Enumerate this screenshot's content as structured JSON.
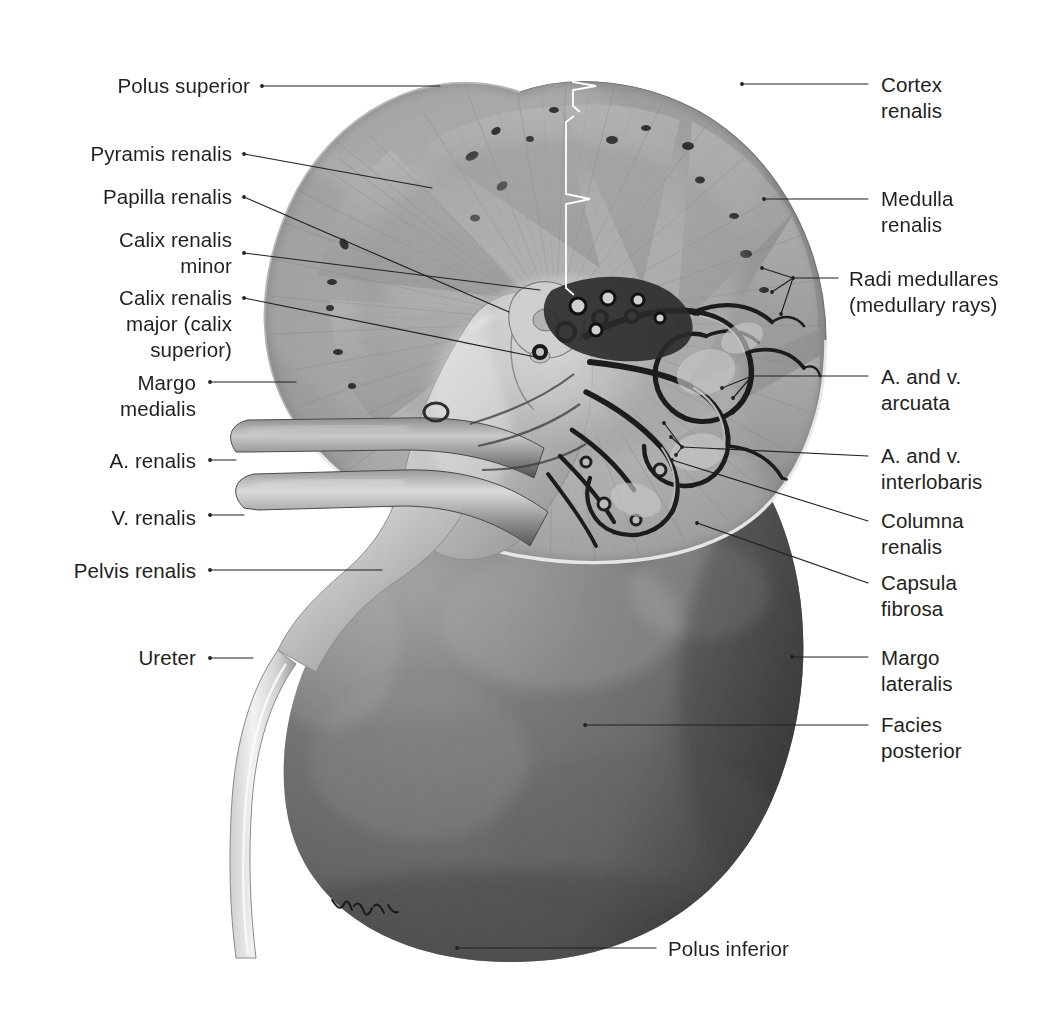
{
  "plate": {
    "title": "Right kidney, frontal section (posterior half), anatomical plate",
    "subject": "Ren (kidney) — coronal section showing cortex, medulla and vasculature",
    "background_color": "#ffffff",
    "text_color": "#231f20",
    "leader_color": "#231f20",
    "bracket_color": "#ffffff",
    "artist_signature": "Voll"
  },
  "labels_left": [
    {
      "id": "polus-superior",
      "text": "Polus superior",
      "align": "right",
      "x": 250,
      "y": 73,
      "lines": [
        "Polus superior"
      ]
    },
    {
      "id": "pyramis-renalis",
      "text": "Pyramis renalis",
      "align": "right",
      "x": 232,
      "y": 141,
      "lines": [
        "Pyramis renalis"
      ]
    },
    {
      "id": "papilla-renalis",
      "text": "Papilla renalis",
      "align": "right",
      "x": 232,
      "y": 184,
      "lines": [
        "Papilla renalis"
      ]
    },
    {
      "id": "calix-renalis-minor",
      "text": "Calix renalis minor",
      "align": "right",
      "x": 232,
      "y": 227,
      "lines": [
        "Calix renalis",
        "minor"
      ]
    },
    {
      "id": "calix-renalis-major",
      "text": "Calix renalis major (calix superior)",
      "align": "right",
      "x": 232,
      "y": 285,
      "lines": [
        "Calix renalis",
        "major (calix",
        "superior)"
      ]
    },
    {
      "id": "margo-medialis",
      "text": "Margo medialis",
      "align": "right",
      "x": 196,
      "y": 370,
      "lines": [
        "Margo",
        "medialis"
      ]
    },
    {
      "id": "a-renalis",
      "text": "A. renalis",
      "align": "right",
      "x": 196,
      "y": 448,
      "lines": [
        "A. renalis"
      ]
    },
    {
      "id": "v-renalis",
      "text": "V. renalis",
      "align": "right",
      "x": 196,
      "y": 505,
      "lines": [
        "V. renalis"
      ]
    },
    {
      "id": "pelvis-renalis",
      "text": "Pelvis renalis",
      "align": "right",
      "x": 196,
      "y": 558,
      "lines": [
        "Pelvis renalis"
      ]
    },
    {
      "id": "ureter",
      "text": "Ureter",
      "align": "right",
      "x": 196,
      "y": 645,
      "lines": [
        "Ureter"
      ]
    }
  ],
  "labels_right": [
    {
      "id": "cortex-renalis",
      "text": "Cortex renalis",
      "align": "left",
      "x": 881,
      "y": 72,
      "lines": [
        "Cortex",
        "renalis"
      ]
    },
    {
      "id": "medulla-renalis",
      "text": "Medulla renalis",
      "align": "left",
      "x": 881,
      "y": 186,
      "lines": [
        "Medulla",
        "renalis"
      ]
    },
    {
      "id": "radi-medullares",
      "text": "Radi medullares (medullary rays)",
      "align": "left",
      "x": 849,
      "y": 266,
      "lines": [
        "Radi medullares",
        "(medullary rays)"
      ]
    },
    {
      "id": "a-v-arcuata",
      "text": "A. and v. arcuata",
      "align": "left",
      "x": 881,
      "y": 364,
      "lines": [
        "A. and v.",
        "arcuata"
      ]
    },
    {
      "id": "a-v-interlobaris",
      "text": "A. and v. interlobaris",
      "align": "left",
      "x": 881,
      "y": 443,
      "lines": [
        "A. and v.",
        "interlobaris"
      ]
    },
    {
      "id": "columna-renalis",
      "text": "Columna renalis",
      "align": "left",
      "x": 881,
      "y": 508,
      "lines": [
        "Columna",
        "renalis"
      ]
    },
    {
      "id": "capsula-fibrosa",
      "text": "Capsula fibrosa",
      "align": "left",
      "x": 881,
      "y": 570,
      "lines": [
        "Capsula",
        "fibrosa"
      ]
    },
    {
      "id": "margo-lateralis",
      "text": "Margo lateralis",
      "align": "left",
      "x": 881,
      "y": 645,
      "lines": [
        "Margo",
        "lateralis"
      ]
    },
    {
      "id": "facies-posterior",
      "text": "Facies posterior",
      "align": "left",
      "x": 881,
      "y": 712,
      "lines": [
        "Facies",
        "posterior"
      ]
    }
  ],
  "labels_bottom": [
    {
      "id": "polus-inferior",
      "text": "Polus inferior",
      "align": "left",
      "x": 668,
      "y": 936,
      "lines": [
        "Polus inferior"
      ]
    }
  ],
  "leaders": [
    {
      "id": "leader-polus-superior",
      "for": "polus-superior",
      "points": [
        [
          262,
          86
        ],
        [
          440,
          86
        ]
      ]
    },
    {
      "id": "leader-pyramis-renalis",
      "for": "pyramis-renalis",
      "points": [
        [
          244,
          154
        ],
        [
          432,
          188
        ]
      ]
    },
    {
      "id": "leader-papilla-renalis",
      "for": "papilla-renalis",
      "points": [
        [
          244,
          197
        ],
        [
          509,
          312
        ]
      ]
    },
    {
      "id": "leader-calix-minor",
      "for": "calix-renalis-minor",
      "points": [
        [
          244,
          253
        ],
        [
          540,
          290
        ]
      ]
    },
    {
      "id": "leader-calix-major",
      "for": "calix-renalis-major",
      "points": [
        [
          244,
          298
        ],
        [
          536,
          357
        ]
      ]
    },
    {
      "id": "leader-margo-medialis",
      "for": "margo-medialis",
      "points": [
        [
          210,
          382
        ],
        [
          296,
          382
        ]
      ]
    },
    {
      "id": "leader-a-renalis",
      "for": "a-renalis",
      "points": [
        [
          210,
          460
        ],
        [
          236,
          460
        ]
      ]
    },
    {
      "id": "leader-v-renalis",
      "for": "v-renalis",
      "points": [
        [
          210,
          515
        ],
        [
          244,
          515
        ]
      ]
    },
    {
      "id": "leader-pelvis-renalis",
      "for": "pelvis-renalis",
      "points": [
        [
          210,
          570
        ],
        [
          382,
          570
        ]
      ]
    },
    {
      "id": "leader-ureter",
      "for": "ureter",
      "points": [
        [
          210,
          658
        ],
        [
          253,
          658
        ]
      ]
    },
    {
      "id": "leader-cortex-renalis",
      "for": "cortex-renalis",
      "points": [
        [
          742,
          84
        ],
        [
          868,
          84
        ]
      ]
    },
    {
      "id": "leader-medulla-renalis",
      "for": "medulla-renalis",
      "points": [
        [
          764,
          199
        ],
        [
          868,
          199
        ]
      ]
    },
    {
      "id": "leader-radi-a",
      "for": "radi-medullares",
      "points": [
        [
          762,
          268
        ],
        [
          793,
          278
        ]
      ]
    },
    {
      "id": "leader-radi-b",
      "for": "radi-medullares",
      "points": [
        [
          772,
          292
        ],
        [
          793,
          278
        ]
      ]
    },
    {
      "id": "leader-radi-c",
      "for": "radi-medullares",
      "points": [
        [
          781,
          314
        ],
        [
          793,
          278
        ]
      ]
    },
    {
      "id": "leader-radi-main",
      "for": "radi-medullares",
      "points": [
        [
          793,
          278
        ],
        [
          838,
          278
        ]
      ]
    },
    {
      "id": "leader-arcuata-a",
      "for": "a-v-arcuata",
      "points": [
        [
          722,
          388
        ],
        [
          752,
          376
        ]
      ]
    },
    {
      "id": "leader-arcuata-b",
      "for": "a-v-arcuata",
      "points": [
        [
          733,
          398
        ],
        [
          752,
          376
        ]
      ]
    },
    {
      "id": "leader-arcuata-main",
      "for": "a-v-arcuata",
      "points": [
        [
          752,
          376
        ],
        [
          868,
          376
        ]
      ]
    },
    {
      "id": "leader-interlob-a",
      "for": "a-v-interlobaris",
      "points": [
        [
          664,
          423
        ],
        [
          682,
          447
        ]
      ]
    },
    {
      "id": "leader-interlob-b",
      "for": "a-v-interlobaris",
      "points": [
        [
          671,
          437
        ],
        [
          682,
          447
        ]
      ]
    },
    {
      "id": "leader-interlob-c",
      "for": "a-v-interlobaris",
      "points": [
        [
          676,
          455
        ],
        [
          682,
          447
        ]
      ]
    },
    {
      "id": "leader-interlob-main",
      "for": "a-v-interlobaris",
      "points": [
        [
          682,
          447
        ],
        [
          868,
          456
        ]
      ]
    },
    {
      "id": "leader-columna-renalis",
      "for": "columna-renalis",
      "points": [
        [
          672,
          460
        ],
        [
          868,
          521
        ]
      ]
    },
    {
      "id": "leader-capsula-fibrosa",
      "for": "capsula-fibrosa",
      "points": [
        [
          697,
          523
        ],
        [
          868,
          583
        ]
      ]
    },
    {
      "id": "leader-margo-lateralis",
      "for": "margo-lateralis",
      "points": [
        [
          792,
          657
        ],
        [
          868,
          657
        ]
      ]
    },
    {
      "id": "leader-facies-posterior",
      "for": "facies-posterior",
      "points": [
        [
          585,
          725
        ],
        [
          868,
          725
        ]
      ]
    },
    {
      "id": "leader-polus-inferior",
      "for": "polus-inferior",
      "points": [
        [
          457,
          948
        ],
        [
          656,
          948
        ]
      ]
    }
  ],
  "brackets": [
    {
      "id": "bracket-cortex-renalis",
      "for": "cortex-renalis",
      "x": 573,
      "y_top": 63,
      "y_bottom": 112,
      "tip_x": 596,
      "tip_y": 86,
      "color": "#ffffff"
    },
    {
      "id": "bracket-medulla-renalis",
      "for": "medulla-renalis",
      "x": 566,
      "y_top": 116,
      "y_bottom": 295,
      "tip_x": 590,
      "tip_y": 199,
      "color": "#ffffff"
    }
  ],
  "anatomy_regions": [
    {
      "id": "cortex-renalis",
      "name": "Cortex renalis",
      "description": "pale outer shell with fine radial striations"
    },
    {
      "id": "medulla-renalis",
      "name": "Medulla renalis",
      "description": "inner zone containing renal pyramids"
    },
    {
      "id": "pyramis-renalis",
      "name": "Pyramis renalis",
      "description": "triangular striated medullary pyramid"
    },
    {
      "id": "papilla-renalis",
      "name": "Papilla renalis",
      "description": "apex of pyramid projecting into minor calyx"
    },
    {
      "id": "pelvis-renalis",
      "name": "Pelvis renalis",
      "description": "funnel-shaped collecting chamber"
    },
    {
      "id": "ureter",
      "name": "Ureter",
      "description": "long pale tube descending from pelvis"
    },
    {
      "id": "a-renalis",
      "name": "A. renalis",
      "description": "renal artery, upper hilar vessel"
    },
    {
      "id": "v-renalis",
      "name": "V. renalis",
      "description": "renal vein, lower hilar vessel"
    },
    {
      "id": "capsula-fibrosa",
      "name": "Capsula fibrosa",
      "description": "thin fibrous capsule along the cut edge"
    },
    {
      "id": "columna-renalis",
      "name": "Columna renalis",
      "description": "cortical column between pyramids"
    }
  ]
}
